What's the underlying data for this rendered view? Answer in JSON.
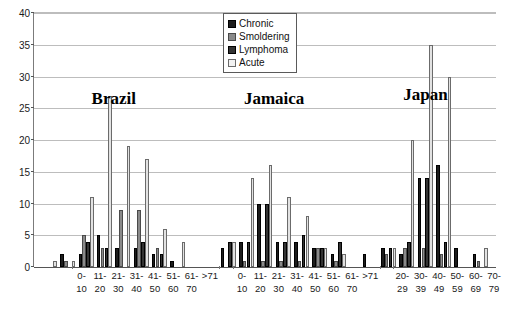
{
  "chart_data": {
    "type": "bar",
    "title": "",
    "xlabel": "",
    "ylabel": "",
    "ylim": [
      0,
      40
    ],
    "yticks": [
      0,
      5,
      10,
      15,
      20,
      25,
      30,
      35,
      40
    ],
    "grid": true,
    "legend_position": "top-center",
    "legend": [
      "Chronic",
      "Smoldering",
      "Lymphoma",
      "Acute"
    ],
    "series_colors": {
      "Chronic": "#1c1c1c",
      "Smoldering": "#8a8a8a",
      "Lymphoma": "#333333",
      "Acute": "#e2e2e2"
    },
    "panels": [
      {
        "name": "Brazil",
        "categories": [
          "0-10",
          "11-20",
          "21-30",
          "31-40",
          "41-50",
          "51-60",
          "61-70",
          ">71"
        ],
        "category_lines": [
          [
            "0-",
            "10"
          ],
          [
            "11-",
            "20"
          ],
          [
            "21-",
            "30"
          ],
          [
            "31-",
            "40"
          ],
          [
            "41-",
            "50"
          ],
          [
            "51-",
            "60"
          ],
          [
            "61-",
            "70"
          ],
          [
            ">71",
            ""
          ]
        ],
        "series": [
          {
            "name": "Chronic",
            "values": [
              0,
              2,
              2,
              5,
              3,
              3,
              2,
              1
            ]
          },
          {
            "name": "Smoldering",
            "values": [
              0,
              1,
              5,
              3,
              9,
              9,
              3,
              0
            ]
          },
          {
            "name": "Lymphoma",
            "values": [
              0,
              0,
              4,
              3,
              0,
              4,
              2,
              0
            ]
          },
          {
            "name": "Acute",
            "values": [
              1,
              1,
              11,
              27,
              19,
              17,
              6,
              4
            ]
          }
        ]
      },
      {
        "name": "Jamaica",
        "categories": [
          "0-10",
          "11-20",
          "21-30",
          "31-40",
          "41-50",
          "51-60",
          "61-70",
          ">71"
        ],
        "category_lines": [
          [
            "0-",
            "10"
          ],
          [
            "11-",
            "20"
          ],
          [
            "21-",
            "30"
          ],
          [
            "31-",
            "40"
          ],
          [
            "41-",
            "50"
          ],
          [
            "51-",
            "60"
          ],
          [
            "61-",
            "70"
          ],
          [
            ">71",
            ""
          ]
        ],
        "series": [
          {
            "name": "Chronic",
            "values": [
              0,
              3,
              4,
              10,
              4,
              4,
              3,
              2
            ]
          },
          {
            "name": "Smoldering",
            "values": [
              0,
              0,
              1,
              1,
              1,
              1,
              3,
              1
            ]
          },
          {
            "name": "Lymphoma",
            "values": [
              0,
              4,
              4,
              10,
              4,
              5,
              3,
              4
            ]
          },
          {
            "name": "Acute",
            "values": [
              0,
              4,
              14,
              16,
              11,
              8,
              3,
              2
            ]
          }
        ]
      },
      {
        "name": "Japan",
        "categories": [
          "20-29",
          "30-39",
          "40-49",
          "50-59",
          "60-69",
          "70-79",
          "80-89"
        ],
        "category_lines": [
          [
            "20-",
            "29"
          ],
          [
            "30-",
            "39"
          ],
          [
            "40-",
            "49"
          ],
          [
            "50-",
            "59"
          ],
          [
            "60-",
            "69"
          ],
          [
            "70-",
            "79"
          ],
          [
            "80-",
            "89"
          ]
        ],
        "series": [
          {
            "name": "Chronic",
            "values": [
              2,
              3,
              2,
              14,
              16,
              3,
              2
            ]
          },
          {
            "name": "Smoldering",
            "values": [
              0,
              2,
              3,
              3,
              2,
              0,
              1
            ]
          },
          {
            "name": "Lymphoma",
            "values": [
              0,
              3,
              4,
              14,
              4,
              0,
              0
            ]
          },
          {
            "name": "Acute",
            "values": [
              0,
              3,
              20,
              35,
              30,
              0,
              3
            ]
          }
        ]
      }
    ]
  }
}
